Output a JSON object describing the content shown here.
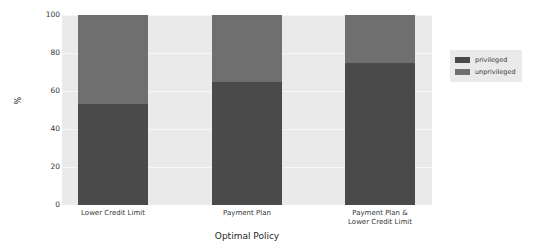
{
  "chart_data": {
    "type": "bar",
    "stacked": true,
    "percent": true,
    "title": "",
    "xlabel": "Optimal Policy",
    "ylabel": "%",
    "categories": [
      "Lower Credit Limit",
      "Payment Plan",
      "Payment Plan &\nLower Credit Limit"
    ],
    "category_lines": [
      [
        "Lower Credit Limit"
      ],
      [
        "Payment Plan"
      ],
      [
        "Payment Plan &",
        "Lower Credit Limit"
      ]
    ],
    "series": [
      {
        "name": "privileged",
        "color": "#4a4a4a",
        "values": [
          53,
          65,
          75
        ]
      },
      {
        "name": "unprivileged",
        "color": "#6f6f6f",
        "values": [
          47,
          35,
          25
        ]
      }
    ],
    "ylim": [
      0,
      100
    ],
    "yticks": [
      100,
      80,
      60,
      40,
      20,
      0
    ],
    "grid": true,
    "legend_position": "right",
    "legend_entries": [
      "privileged",
      "unprivileged"
    ],
    "plot_background": "#eaeaea",
    "gridline_color": "#f7f7f7"
  }
}
